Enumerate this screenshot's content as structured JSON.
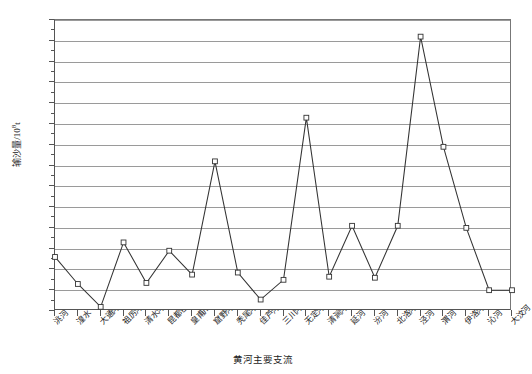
{
  "chart_data": {
    "type": "line",
    "title": "",
    "xlabel": "黄河主要支流",
    "ylabel": "输沙量/10",
    "ylabel_sup": "8",
    "ylabel_unit": "t",
    "ylim": [
      0,
      1.4
    ],
    "ytick_labels": [
      "0",
      "0.1",
      "0.2",
      "0.3",
      "0.4",
      "0.5",
      "0.6",
      "0.7",
      "0.8",
      "0.9",
      "1.0",
      "1.1",
      "1.2",
      "1.3",
      "1.4"
    ],
    "ytick_values": [
      0,
      0.1,
      0.2,
      0.3,
      0.4,
      0.5,
      0.6,
      0.7,
      0.8,
      0.9,
      1.0,
      1.1,
      1.2,
      1.3,
      1.4
    ],
    "grid": true,
    "legend": "none",
    "marker": "open-square",
    "line_color": "#333333",
    "grid_color": "#9a9a9a",
    "categories": [
      "洮河",
      "湟水",
      "大通河",
      "祖厉河",
      "清水河",
      "昆都仑河",
      "皇甫川",
      "窟野河",
      "秃尾河",
      "佳芦河",
      "三川河",
      "无定河",
      "清涧河",
      "延河",
      "汾河",
      "北洛河",
      "泾河",
      "渭河",
      "伊洛河",
      "沁河",
      "大汶河"
    ],
    "values": [
      0.26,
      0.13,
      0.02,
      0.33,
      0.135,
      0.29,
      0.175,
      0.72,
      0.185,
      0.055,
      0.15,
      0.93,
      0.165,
      0.41,
      0.16,
      0.41,
      1.32,
      0.79,
      0.4,
      0.1,
      0.1
    ]
  }
}
